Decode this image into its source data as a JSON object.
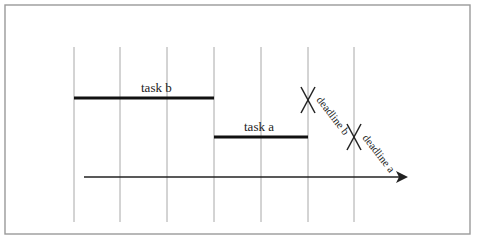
{
  "diagram": {
    "type": "timeline-gantt",
    "frame": {
      "x": 5,
      "y": 5,
      "width": 465,
      "height": 229,
      "color": "#9a9a9a"
    },
    "grid_lines": {
      "x_positions": [
        74,
        120,
        167,
        214,
        261,
        308,
        354
      ],
      "y_start": 47,
      "y_end": 222,
      "color": "#a8a8a8"
    },
    "tasks": [
      {
        "label": "task b",
        "x_start": 74,
        "x_end": 214,
        "y": 98,
        "label_x": 141,
        "label_y": 92
      },
      {
        "label": "task a",
        "x_start": 214,
        "x_end": 308,
        "y": 137,
        "label_x": 244,
        "label_y": 131
      }
    ],
    "deadlines": [
      {
        "label": "deadline b",
        "x": 308,
        "y": 100,
        "label_x": 316,
        "label_y": 100
      },
      {
        "label": "deadline a",
        "x": 354,
        "y": 137,
        "label_x": 362,
        "label_y": 138
      }
    ],
    "time_axis": {
      "x_start": 84,
      "x_end": 408,
      "y": 177,
      "color": "#222222"
    }
  }
}
